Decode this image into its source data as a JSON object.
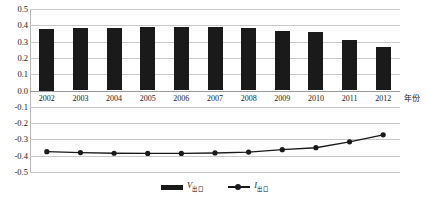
{
  "chart_data": {
    "type": "bar",
    "title": "",
    "xlabel": "年份",
    "ylabel": "",
    "categories": [
      "2002",
      "2003",
      "2004",
      "2005",
      "2006",
      "2007",
      "2008",
      "2009",
      "2010",
      "2011",
      "2012"
    ],
    "ylim": [
      -0.5,
      0.5
    ],
    "ytick_labels": [
      "0.5",
      "0.4",
      "0.3",
      "0.2",
      "0.1",
      "0.0",
      "-0.1",
      "-0.2",
      "-0.3",
      "-0.4",
      "-0.5"
    ],
    "ytick_values": [
      0.5,
      0.4,
      0.3,
      0.2,
      0.1,
      0.0,
      -0.1,
      -0.2,
      -0.3,
      -0.4,
      -0.5
    ],
    "grid": true,
    "legend_position": "bottom-center",
    "series": [
      {
        "name": "V出口",
        "type": "bar",
        "color": "#1a1a1a",
        "values": [
          0.375,
          0.382,
          0.386,
          0.389,
          0.39,
          0.392,
          0.385,
          0.365,
          0.358,
          0.312,
          0.268
        ]
      },
      {
        "name": "I出口",
        "type": "line",
        "color": "#1a1a1a",
        "marker": "circle",
        "values": [
          -0.375,
          -0.381,
          -0.385,
          -0.386,
          -0.386,
          -0.383,
          -0.378,
          -0.363,
          -0.351,
          -0.315,
          -0.272
        ]
      }
    ]
  },
  "legend": {
    "items": [
      {
        "label_main": "V",
        "label_sub": "出口"
      },
      {
        "label_main": "I",
        "label_sub": "出口"
      }
    ]
  },
  "axis": {
    "x_title": "年份"
  }
}
